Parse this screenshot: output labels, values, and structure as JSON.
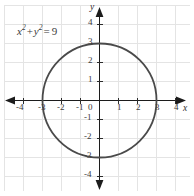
{
  "figure": {
    "equation_parts": {
      "x_var": "x",
      "x_exp": "2",
      "plus": "+",
      "y_var": "y",
      "y_exp": "2",
      "equals": "=",
      "value": "9"
    },
    "equation_text": "x2 + y2 = 9",
    "x_axis_name": "x",
    "y_axis_name": "y",
    "origin_label": "0"
  },
  "chart_data": {
    "type": "line",
    "title": "",
    "subtitle": "",
    "xlabel": "x",
    "ylabel": "y",
    "annotations": [
      {
        "text": "x² + y² = 9",
        "x": -2.8,
        "y": 3.9
      }
    ],
    "legend": [],
    "legend_position": "none",
    "grid": true,
    "grid_spacing": 1,
    "xlim": [
      -4.9,
      4.9
    ],
    "ylim": [
      -4.9,
      4.9
    ],
    "xticks": [
      -4,
      -3,
      -2,
      -1,
      0,
      1,
      2,
      3,
      4
    ],
    "yticks": [
      -4,
      -3,
      -2,
      -1,
      1,
      2,
      3,
      4
    ],
    "xtick_labels": [
      "-4",
      "-3",
      "-2",
      "-1",
      "0",
      "1",
      "2",
      "3",
      "4"
    ],
    "ytick_labels": [
      "-4",
      "-3",
      "-2",
      "-1",
      "1",
      "2",
      "3",
      "4"
    ],
    "series": [
      {
        "name": "x^2 + y^2 = 9",
        "shape": "circle",
        "center": [
          0,
          0
        ],
        "radius": 3,
        "color": "#4a4a4a",
        "intercepts": [
          [
            -3,
            0
          ],
          [
            3,
            0
          ],
          [
            0,
            3
          ],
          [
            0,
            -3
          ]
        ]
      }
    ],
    "colors": {
      "curve": "#4a4a4a",
      "axis": "#1c1c1c",
      "grid": "#e2e2e2",
      "text": "#3b3b3b",
      "background": "#ffffff"
    }
  },
  "x_tick_labels_display": [
    {
      "text": "-4",
      "left": 16,
      "top": 103
    },
    {
      "text": "-3",
      "left": 38,
      "top": 103
    },
    {
      "text": "-2",
      "left": 57,
      "top": 103
    },
    {
      "text": "-1",
      "left": 76,
      "top": 103
    },
    {
      "text": "1",
      "left": 117,
      "top": 103
    },
    {
      "text": "2",
      "left": 136,
      "top": 103
    },
    {
      "text": "3",
      "left": 155,
      "top": 103
    },
    {
      "text": "4",
      "left": 174,
      "top": 103
    }
  ],
  "y_tick_labels_display": [
    {
      "text": "4",
      "left": 88,
      "top": 18
    },
    {
      "text": "3",
      "left": 88,
      "top": 37
    },
    {
      "text": "2",
      "left": 88,
      "top": 56
    },
    {
      "text": "1",
      "left": 88,
      "top": 75
    },
    {
      "text": "-1",
      "left": 84,
      "top": 113
    },
    {
      "text": "-2",
      "left": 84,
      "top": 132
    },
    {
      "text": "-3",
      "left": 84,
      "top": 151
    },
    {
      "text": "-4",
      "left": 84,
      "top": 170
    }
  ]
}
